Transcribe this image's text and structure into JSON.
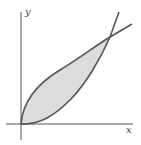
{
  "figure": {
    "axes": {
      "x_label": "x",
      "y_label": "y"
    },
    "curves": [
      {
        "name": "upper-curve",
        "description": "sqrt-like curve from origin"
      },
      {
        "name": "lower-curve",
        "description": "parabola-like curve from origin"
      }
    ],
    "shaded_region": {
      "description": "region between the two curves, from origin to their intersection",
      "fill": "#dcdcdc"
    },
    "colors": {
      "curve": "#555555",
      "axis": "#555555"
    }
  }
}
